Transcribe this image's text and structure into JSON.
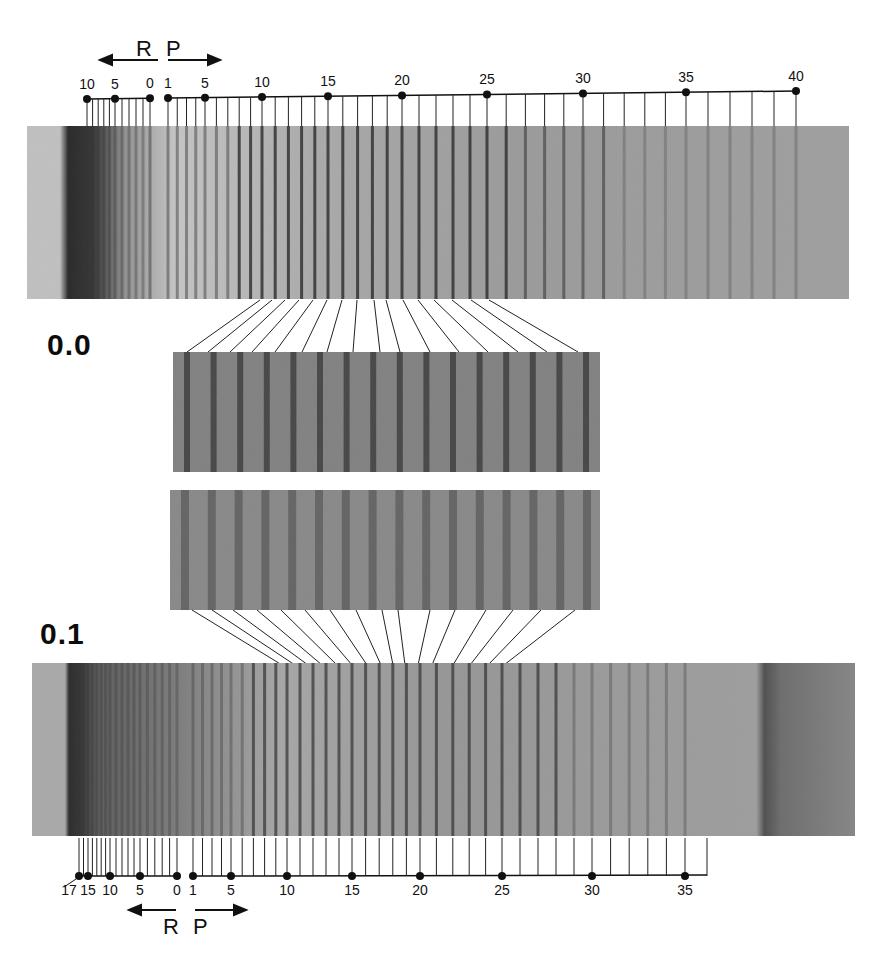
{
  "figure": {
    "panels": [
      {
        "id": "top",
        "label": "0.0",
        "branch_labels": {
          "left": "R",
          "right": "P"
        },
        "spectrum": {
          "x": 27,
          "y": 126,
          "w": 822,
          "h": 173,
          "bg": "#a9a9a9",
          "bandhead_x": 62
        },
        "ruler": {
          "R_ticks": [
            {
              "n": 10,
              "x": 87
            },
            {
              "n": 5,
              "x": 115
            },
            {
              "n": 0,
              "x": 150
            }
          ],
          "P_ticks": [
            {
              "n": 1,
              "x": 168
            },
            {
              "n": 5,
              "x": 205
            },
            {
              "n": 10,
              "x": 262
            },
            {
              "n": 15,
              "x": 328
            },
            {
              "n": 20,
              "x": 402
            },
            {
              "n": 25,
              "x": 487
            },
            {
              "n": 30,
              "x": 583
            },
            {
              "n": 35,
              "x": 686
            },
            {
              "n": 40,
              "x": 796
            }
          ],
          "labels": [
            "10",
            "5",
            "0",
            "1",
            "5",
            "10",
            "15",
            "20",
            "25",
            "30",
            "35",
            "40"
          ]
        }
      },
      {
        "id": "bottom",
        "label": "0.1",
        "branch_labels": {
          "left": "R",
          "right": "P"
        },
        "spectrum": {
          "x": 32,
          "y": 663,
          "w": 823,
          "h": 173,
          "bg": "#a0a0a0",
          "bandhead_x": 68,
          "dark_band_x": 765
        },
        "ruler": {
          "R_ticks": [
            {
              "n": 17,
              "x": 79
            },
            {
              "n": 15,
              "x": 88
            },
            {
              "n": 10,
              "x": 110
            },
            {
              "n": 5,
              "x": 140
            },
            {
              "n": 0,
              "x": 177
            }
          ],
          "P_ticks": [
            {
              "n": 1,
              "x": 193
            },
            {
              "n": 5,
              "x": 231
            },
            {
              "n": 10,
              "x": 287
            },
            {
              "n": 15,
              "x": 352
            },
            {
              "n": 20,
              "x": 420
            },
            {
              "n": 25,
              "x": 502
            },
            {
              "n": 30,
              "x": 592
            },
            {
              "n": 35,
              "x": 685
            }
          ],
          "labels": [
            "17",
            "15",
            "10",
            "5",
            "0",
            "1",
            "5",
            "10",
            "15",
            "20",
            "25",
            "30",
            "35"
          ]
        }
      }
    ],
    "insets": [
      {
        "id": "inset-upper",
        "x": 173,
        "y": 352,
        "w": 427,
        "h": 120
      },
      {
        "id": "inset-lower",
        "x": 170,
        "y": 490,
        "w": 430,
        "h": 120
      }
    ]
  }
}
